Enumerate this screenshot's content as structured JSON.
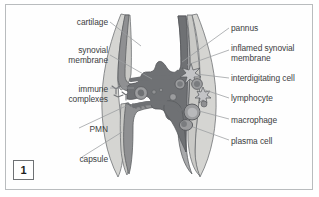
{
  "figure": {
    "number": "1",
    "frame_border_color": "#b9bcbe",
    "background_color": "#fefefe"
  },
  "labels_left": [
    {
      "name": "cartilage",
      "text": "cartilage",
      "x": 22,
      "y": 17,
      "width": 86
    },
    {
      "name": "synovial-membrane",
      "text": "synovial\nmembrane",
      "x": 18,
      "y": 45,
      "width": 90
    },
    {
      "name": "immune-complexes",
      "text": "immune\ncomplexes",
      "x": 18,
      "y": 84,
      "width": 90
    },
    {
      "name": "pmn",
      "text": "PMN",
      "x": 48,
      "y": 124,
      "width": 60
    },
    {
      "name": "capsule",
      "text": "capsule",
      "x": 38,
      "y": 154,
      "width": 70
    }
  ],
  "labels_right": [
    {
      "name": "pannus",
      "text": "pannus",
      "x": 231,
      "y": 23,
      "width": 88
    },
    {
      "name": "inflamed-synovial-membrane",
      "text": "inflamed synovial\nmembrane",
      "x": 231,
      "y": 43,
      "width": 88
    },
    {
      "name": "interdigitating-cell",
      "text": "interdigitating cell",
      "x": 231,
      "y": 73,
      "width": 90
    },
    {
      "name": "lymphocyte",
      "text": "lymphocyte",
      "x": 231,
      "y": 93,
      "width": 88
    },
    {
      "name": "macrophage",
      "text": "macrophage",
      "x": 231,
      "y": 115,
      "width": 88
    },
    {
      "name": "plasma-cell",
      "text": "plasma cell",
      "x": 231,
      "y": 136,
      "width": 88
    }
  ],
  "colors": {
    "capsule_fill": "#d5d5d2",
    "cartilage_fill": "#c9c9c6",
    "synovium_fill": "#8f9092",
    "pannus_fill": "#6f7174",
    "cell_fill": "#9b9c9e",
    "outline": "#5d5f62",
    "leader_line": "#9a9c9f",
    "text": "#3b3d40"
  },
  "illustration": {
    "name": "rheumatoid-arthritis-joint-cross-section",
    "description": "Cross-section of a synovial joint showing cartilage, synovial membrane, capsule, joint space with immune complexes and PMN, and inflamed pannus tissue containing interdigitating cells, lymphocytes, macrophages and plasma cells"
  }
}
